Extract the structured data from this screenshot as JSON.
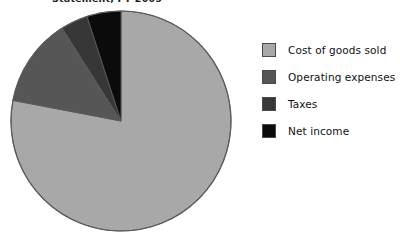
{
  "chart_data": {
    "type": "pie",
    "title": "Statement, FY 2005",
    "xlabel": "",
    "ylabel": "",
    "legend_position": "right",
    "grid": false,
    "start_angle_deg": 0,
    "direction": "clockwise",
    "categories": [
      "Cost of goods sold",
      "Operating expenses",
      "Taxes",
      "Net income"
    ],
    "values": [
      78,
      13,
      4,
      5
    ],
    "units": "percent",
    "colors": [
      "#a8a8a8",
      "#565656",
      "#373737",
      "#0b0b0b"
    ],
    "slices": [
      {
        "label": "Cost of goods sold",
        "value": 78,
        "color": "#a8a8a8",
        "start_deg": 0,
        "end_deg": 280.8
      },
      {
        "label": "Operating expenses",
        "value": 13,
        "color": "#565656",
        "start_deg": 280.8,
        "end_deg": 327.6
      },
      {
        "label": "Taxes",
        "value": 4,
        "color": "#373737",
        "start_deg": 327.6,
        "end_deg": 342.0
      },
      {
        "label": "Net income",
        "value": 5,
        "color": "#0b0b0b",
        "start_deg": 342.0,
        "end_deg": 360.0
      }
    ]
  },
  "legend": {
    "items": [
      {
        "label": "Cost of goods sold",
        "color": "#a8a8a8"
      },
      {
        "label": "Operating expenses",
        "color": "#565656"
      },
      {
        "label": "Taxes",
        "color": "#373737"
      },
      {
        "label": "Net income",
        "color": "#0b0b0b"
      }
    ]
  },
  "pie_geometry": {
    "cx": 111,
    "cy": 111,
    "r": 110,
    "stroke": "#5a5a5a"
  }
}
